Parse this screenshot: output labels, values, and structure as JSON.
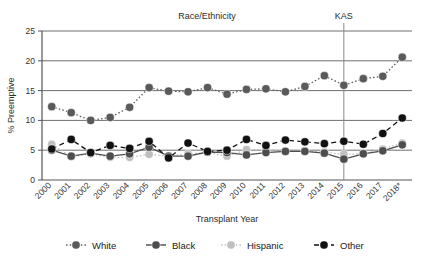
{
  "chart_data": {
    "type": "line",
    "title": "Race/Ethnicity",
    "xlabel": "Transplant Year",
    "ylabel": "% Preemptive",
    "categories": [
      "2000",
      "2001",
      "2002",
      "2003",
      "2004",
      "2005",
      "2006",
      "2007",
      "2008",
      "2009",
      "2010",
      "2011",
      "2012",
      "2013",
      "2014",
      "2015",
      "2016",
      "2017",
      "2018*"
    ],
    "ylim": [
      0,
      25
    ],
    "yticks": [
      0,
      5,
      10,
      15,
      20,
      25
    ],
    "grid": true,
    "legend_position": "bottom",
    "annotations": [
      {
        "label": "KAS",
        "type": "vertical-line",
        "at_category": "2015"
      }
    ],
    "series": [
      {
        "name": "White",
        "color": "#5a5a5a",
        "line_style": "dotted",
        "values": [
          12.3,
          11.3,
          10.0,
          10.5,
          12.2,
          15.5,
          14.9,
          14.8,
          15.5,
          14.4,
          15.2,
          15.3,
          14.8,
          15.7,
          17.5,
          15.9,
          17.0,
          17.4,
          20.6
        ]
      },
      {
        "name": "Black",
        "color": "#4d4d4d",
        "line_style": "solid",
        "values": [
          5.0,
          4.0,
          4.5,
          4.0,
          4.4,
          5.5,
          4.0,
          4.0,
          4.7,
          4.6,
          4.2,
          4.6,
          4.8,
          4.8,
          4.5,
          3.5,
          4.4,
          4.9,
          5.9
        ]
      },
      {
        "name": "Hispanic",
        "color": "#bfbfbf",
        "line_style": "dotted",
        "values": [
          6.0,
          3.9,
          4.4,
          3.8,
          3.8,
          4.3,
          4.0,
          4.4,
          4.6,
          4.0,
          5.1,
          5.0,
          4.8,
          4.9,
          4.7,
          4.3,
          4.4,
          5.2,
          6.2
        ]
      },
      {
        "name": "Other",
        "color": "#111111",
        "line_style": "dashed",
        "values": [
          5.2,
          6.8,
          4.6,
          5.8,
          5.3,
          6.5,
          3.7,
          6.2,
          4.8,
          5.0,
          6.8,
          5.8,
          6.7,
          6.4,
          6.1,
          6.5,
          6.0,
          7.8,
          10.4
        ]
      }
    ]
  },
  "axes": {
    "ytick_labels": [
      "0",
      "5",
      "10",
      "15",
      "20",
      "25"
    ]
  },
  "legend": {
    "items": [
      {
        "label": "White"
      },
      {
        "label": "Black"
      },
      {
        "label": "Hispanic"
      },
      {
        "label": "Other"
      }
    ]
  }
}
